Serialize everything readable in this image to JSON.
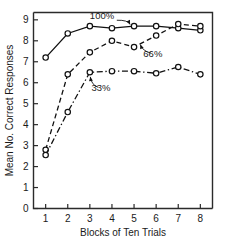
{
  "chart_data": {
    "type": "line",
    "title": "",
    "xlabel": "Blocks of Ten Trials",
    "ylabel": "Mean No. Correct Responses",
    "categories": [
      1,
      2,
      3,
      4,
      5,
      6,
      7,
      8
    ],
    "x": [
      1,
      2,
      3,
      4,
      5,
      6,
      7,
      8
    ],
    "xlim": [
      0.45,
      8.55
    ],
    "ylim": [
      0,
      9.35
    ],
    "xticklabels": [
      "1",
      "2",
      "3",
      "4",
      "5",
      "6",
      "7",
      "8"
    ],
    "yticklabels": [
      "0",
      "1",
      "2",
      "3",
      "4",
      "5",
      "6",
      "7",
      "8",
      "9"
    ],
    "yticks": [
      0,
      1,
      2,
      3,
      4,
      5,
      6,
      7,
      8,
      9
    ],
    "grid": false,
    "legend_position": "inline-annotations",
    "marker": "open-circle",
    "series": [
      {
        "name": "100%",
        "label": "100%",
        "linestyle": "solid",
        "color": "#111111",
        "values": [
          7.2,
          8.35,
          8.7,
          8.6,
          8.7,
          8.7,
          8.6,
          8.5
        ]
      },
      {
        "name": "66%",
        "label": "66%",
        "linestyle": "dashed",
        "color": "#111111",
        "values": [
          2.8,
          6.4,
          7.45,
          8.0,
          7.7,
          8.25,
          8.8,
          8.7
        ]
      },
      {
        "name": "33%",
        "label": "33%",
        "linestyle": "dashdot",
        "color": "#111111",
        "values": [
          2.55,
          4.6,
          6.5,
          6.55,
          6.55,
          6.45,
          6.75,
          6.4
        ]
      }
    ],
    "annotations": [
      {
        "text": "100%",
        "x": 3.55,
        "y": 9.05
      },
      {
        "text": "66%",
        "x": 5.85,
        "y": 7.25
      },
      {
        "text": "33%",
        "x": 3.5,
        "y": 5.6
      }
    ]
  },
  "axes": {
    "xlabel": "Blocks of Ten Trials",
    "ylabel": "Mean No. Correct Responses"
  }
}
